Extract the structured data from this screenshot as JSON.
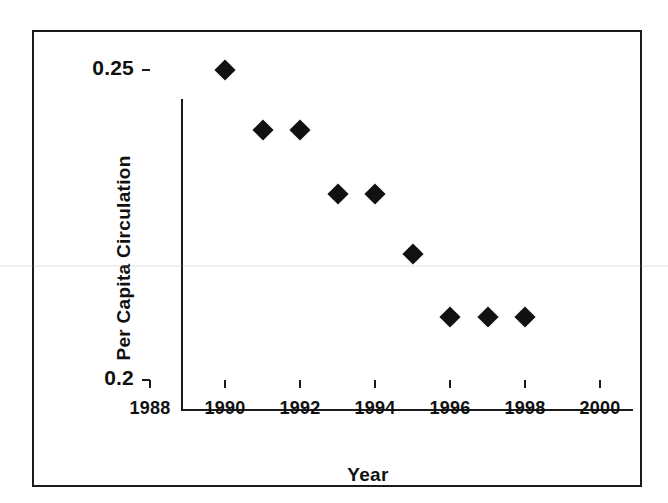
{
  "chart_data": {
    "type": "scatter",
    "title": "",
    "xlabel": "Year",
    "ylabel": "Per Capita Circulation",
    "x": [
      1990,
      1991,
      1992,
      1993,
      1994,
      1995,
      1996,
      1997,
      1998
    ],
    "values": [
      0.25,
      0.2403,
      0.2403,
      0.23,
      0.23,
      0.2203,
      0.2102,
      0.2102,
      0.2102
    ],
    "series": [
      {
        "name": "Per Capita Circulation",
        "points": [
          {
            "x": 1990,
            "y": 0.25
          },
          {
            "x": 1991,
            "y": 0.2403
          },
          {
            "x": 1992,
            "y": 0.2403
          },
          {
            "x": 1993,
            "y": 0.23
          },
          {
            "x": 1994,
            "y": 0.23
          },
          {
            "x": 1995,
            "y": 0.2203
          },
          {
            "x": 1996,
            "y": 0.2102
          },
          {
            "x": 1997,
            "y": 0.2102
          },
          {
            "x": 1998,
            "y": 0.2102
          }
        ]
      }
    ],
    "xlim": [
      1988,
      2000
    ],
    "ylim": [
      0.2,
      0.25
    ],
    "xticks": [
      1988,
      1990,
      1992,
      1994,
      1996,
      1998,
      2000
    ],
    "xtick_labels": [
      "1988",
      "1990",
      "1992",
      "1994",
      "1996",
      "1998",
      "2000"
    ],
    "yticks": [
      0.2,
      0.25
    ],
    "ytick_labels": [
      "0.2",
      "0.25"
    ],
    "grid": false,
    "legend": false,
    "legend_position": "none",
    "marker_shape": "diamond",
    "marker_color": "#111111",
    "axis_color": "#1a1a1a",
    "background_color": "#ffffff",
    "frame": true
  }
}
